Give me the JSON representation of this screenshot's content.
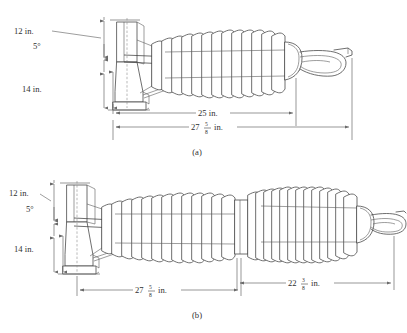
{
  "figure": {
    "background_color": "#ffffff",
    "line_color": "#4a4a4a",
    "dimension_color": "#6a6a6a",
    "text_color": "#2f2f2f",
    "panels": [
      {
        "caption": "(a)",
        "description": "station post insulator, single shed stack with base flange and terminal clamp",
        "shed_count": 13,
        "vertical_dimensions": [
          {
            "name": "top-height",
            "label": "12 in."
          },
          {
            "name": "taper-angle",
            "label": "5°"
          },
          {
            "name": "base-height",
            "label": "14 in."
          }
        ],
        "horizontal_dimensions": [
          {
            "name": "insulator-length",
            "label": "25 in."
          },
          {
            "name": "overall-length",
            "whole": "27",
            "numerator": "5",
            "denominator": "8",
            "unit": "in."
          }
        ]
      },
      {
        "caption": "(b)",
        "description": "tandem station post insulator, two shed stacks with base flange and terminal clamp",
        "shed_count_stack1": 13,
        "shed_count_stack2": 14,
        "vertical_dimensions": [
          {
            "name": "top-height",
            "label": "12 in."
          },
          {
            "name": "taper-angle",
            "label": "5°"
          },
          {
            "name": "base-height",
            "label": "14 in."
          }
        ],
        "horizontal_dimensions": [
          {
            "name": "first-section-length",
            "whole": "27",
            "numerator": "5",
            "denominator": "8",
            "unit": "in."
          },
          {
            "name": "second-section-length",
            "whole": "22",
            "numerator": "3",
            "denominator": "8",
            "unit": "in."
          }
        ]
      }
    ]
  }
}
